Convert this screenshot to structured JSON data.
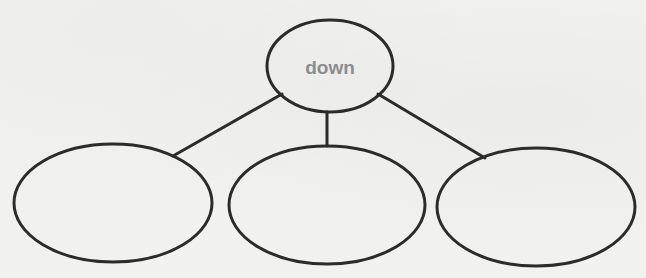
{
  "diagram": {
    "type": "tree-map graphic organizer",
    "colors": {
      "background": "#f1f1f0",
      "stroke": "#2b2b2b",
      "label": "#8c8c8c"
    },
    "root": {
      "label": "down",
      "cx": 330,
      "cy": 66,
      "rx": 63,
      "ry": 46
    },
    "children": [
      {
        "label": "",
        "cx": 113,
        "cy": 203,
        "rx": 99,
        "ry": 59
      },
      {
        "label": "",
        "cx": 327,
        "cy": 205,
        "rx": 98,
        "ry": 59
      },
      {
        "label": "",
        "cx": 536,
        "cy": 207,
        "rx": 99,
        "ry": 59
      }
    ],
    "connectors": [
      {
        "x1": 282,
        "y1": 94,
        "x2": 173,
        "y2": 156
      },
      {
        "x1": 327,
        "y1": 112,
        "x2": 327,
        "y2": 146
      },
      {
        "x1": 378,
        "y1": 94,
        "x2": 485,
        "y2": 158
      }
    ]
  }
}
